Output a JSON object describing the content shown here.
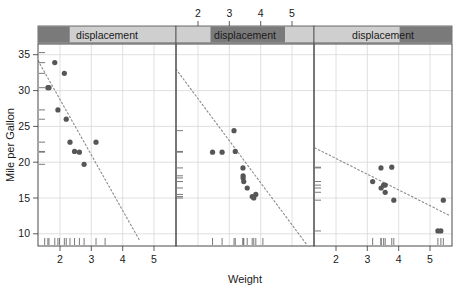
{
  "figure": {
    "type": "trellis-scatter",
    "width": 459,
    "height": 291,
    "background": "#ffffff",
    "point_color": "#565656",
    "line_color": "#8a8a8a",
    "grid_color": "#d8d8d8",
    "axis_color": "#4a4a4a",
    "strip_dark": "#7a7a7a",
    "strip_light": "#cfcfcf"
  },
  "axes": {
    "ylabel": "Mile per Gallon",
    "xlabel": "Weight",
    "yticks": [
      "10",
      "15",
      "20",
      "25",
      "30",
      "35"
    ],
    "ytick_values": [
      10,
      15,
      20,
      25,
      30,
      35
    ],
    "ylim": [
      8.3,
      36.5
    ],
    "xticks": [
      "2",
      "3",
      "4",
      "5"
    ],
    "xtick_values": [
      2,
      3,
      4,
      5
    ],
    "xlim": [
      1.3,
      5.7
    ]
  },
  "strips": [
    {
      "label": "displacement",
      "shade_start_pct": 0,
      "shade_end_pct": 23
    },
    {
      "label": "displacement",
      "shade_start_pct": 25,
      "shade_end_pct": 79
    },
    {
      "label": "displacement",
      "shade_start_pct": 62,
      "shade_end_pct": 100
    }
  ],
  "panels": [
    {
      "name": "panel-1",
      "strip_index": 0,
      "xaxis_side": "bottom",
      "points": [
        {
          "x": 1.615,
          "y": 30.4
        },
        {
          "x": 1.65,
          "y": 30.4
        },
        {
          "x": 1.835,
          "y": 33.9
        },
        {
          "x": 1.935,
          "y": 27.3
        },
        {
          "x": 2.14,
          "y": 32.4
        },
        {
          "x": 2.2,
          "y": 26.0
        },
        {
          "x": 2.32,
          "y": 22.8
        },
        {
          "x": 2.465,
          "y": 21.5
        },
        {
          "x": 2.62,
          "y": 21.4
        },
        {
          "x": 2.77,
          "y": 19.7
        },
        {
          "x": 3.15,
          "y": 22.8
        }
      ],
      "fit_line": {
        "x1": 1.3,
        "y1": 34.2,
        "x2": 4.55,
        "y2": 9.0
      },
      "x_rug": [
        1.513,
        1.615,
        1.65,
        1.835,
        1.935,
        1.985,
        2.14,
        2.2,
        2.32,
        2.465,
        2.62,
        2.77,
        3.15,
        3.44
      ],
      "y_rug": [
        19.7,
        21.4,
        21.5,
        22.8,
        26.0,
        27.3,
        30.4,
        32.4,
        33.9,
        35.3
      ]
    },
    {
      "name": "panel-2",
      "strip_index": 1,
      "xaxis_side": "top",
      "points": [
        {
          "x": 2.465,
          "y": 21.4
        },
        {
          "x": 2.77,
          "y": 21.4
        },
        {
          "x": 3.15,
          "y": 24.4
        },
        {
          "x": 3.19,
          "y": 21.5
        },
        {
          "x": 3.435,
          "y": 19.2
        },
        {
          "x": 3.44,
          "y": 18.1
        },
        {
          "x": 3.44,
          "y": 17.8
        },
        {
          "x": 3.46,
          "y": 17.3
        },
        {
          "x": 3.57,
          "y": 16.4
        },
        {
          "x": 3.73,
          "y": 15.2
        },
        {
          "x": 3.845,
          "y": 15.5
        },
        {
          "x": 3.78,
          "y": 15.0
        }
      ],
      "fit_line": {
        "x1": 1.3,
        "y1": 33.0,
        "x2": 5.45,
        "y2": 8.6
      },
      "x_rug": [
        2.465,
        2.77,
        3.15,
        3.19,
        3.435,
        3.44,
        3.46,
        3.57,
        3.73,
        3.78,
        3.845,
        4.07
      ],
      "y_rug": [
        15.0,
        15.2,
        15.5,
        16.4,
        17.3,
        17.8,
        18.1,
        19.2,
        21.4,
        21.5,
        24.4
      ]
    },
    {
      "name": "panel-3",
      "strip_index": 2,
      "xaxis_side": "bottom",
      "points": [
        {
          "x": 3.17,
          "y": 17.3
        },
        {
          "x": 3.435,
          "y": 19.2
        },
        {
          "x": 3.44,
          "y": 16.4
        },
        {
          "x": 3.52,
          "y": 16.8
        },
        {
          "x": 3.57,
          "y": 16.8
        },
        {
          "x": 3.57,
          "y": 15.8
        },
        {
          "x": 3.78,
          "y": 19.3
        },
        {
          "x": 3.845,
          "y": 14.7
        },
        {
          "x": 5.25,
          "y": 10.4
        },
        {
          "x": 5.345,
          "y": 10.4
        },
        {
          "x": 5.424,
          "y": 14.7
        }
      ],
      "fit_line": {
        "x1": 1.33,
        "y1": 22.0,
        "x2": 5.65,
        "y2": 12.5
      },
      "x_rug": [
        3.17,
        3.435,
        3.44,
        3.52,
        3.57,
        3.78,
        3.845,
        5.25,
        5.345,
        5.424
      ],
      "y_rug": [
        10.4,
        14.7,
        15.8,
        16.4,
        16.8,
        17.3,
        19.2,
        19.3
      ]
    }
  ]
}
